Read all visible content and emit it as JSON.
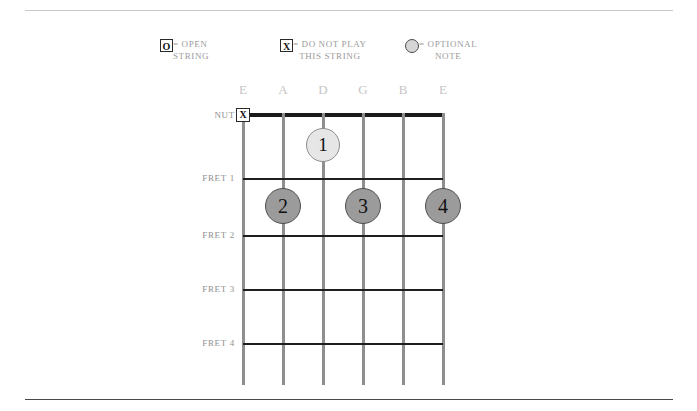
{
  "legend": {
    "items": [
      {
        "name": "open-string",
        "glyph_type": "box",
        "glyph": "O",
        "equals": "=",
        "line1": "= OPEN",
        "line2": "STRING"
      },
      {
        "name": "do-not-play",
        "glyph_type": "box",
        "glyph": "X",
        "equals": "=",
        "line1": "= DO NOT PLAY",
        "line2": "THIS STRING"
      },
      {
        "name": "optional-note",
        "glyph_type": "circle",
        "glyph": "",
        "equals": "=",
        "line1": "= OPTIONAL",
        "line2": "NOTE"
      }
    ]
  },
  "diagram": {
    "nut_label": "NUT",
    "string_labels": [
      "E",
      "A",
      "D",
      "G",
      "B",
      "E"
    ],
    "fret_labels": [
      "FRET 1",
      "FRET 2",
      "FRET 3",
      "FRET 4"
    ],
    "nut_markers": [
      {
        "string": 1,
        "symbol": "X"
      }
    ],
    "fingerings": [
      {
        "label": "1",
        "string": 3,
        "fret": 1,
        "style": "optional"
      },
      {
        "label": "2",
        "string": 2,
        "fret": 2,
        "style": "normal"
      },
      {
        "label": "3",
        "string": 4,
        "fret": 2,
        "style": "normal"
      },
      {
        "label": "4",
        "string": 6,
        "fret": 2,
        "style": "normal"
      }
    ]
  },
  "colors": {
    "nut": "#1a1a1a",
    "fret": "#1f1f1f",
    "string": "#8e8e8e",
    "dot_normal": "#9b9b9b",
    "dot_optional": "#e6e6e6",
    "label_text": "#9b9b9b",
    "string_label": "#c5c5c5",
    "rule_top": "#c9c9c9",
    "rule_bottom": "#4a4a4a"
  }
}
